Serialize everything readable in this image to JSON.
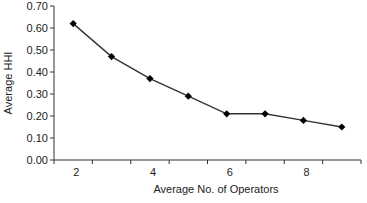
{
  "chart_data": {
    "type": "line",
    "title": "",
    "xlabel": "Average No. of Operators",
    "ylabel": "Average HHI",
    "categories": [
      2,
      3,
      4,
      5,
      6,
      7,
      8,
      9
    ],
    "x_tick_labels": [
      "2",
      "4",
      "6",
      "8"
    ],
    "y_tick_labels": [
      "0.00",
      "0.10",
      "0.20",
      "0.30",
      "0.40",
      "0.50",
      "0.60",
      "0.70"
    ],
    "ylim": [
      0,
      0.7
    ],
    "grid": false,
    "legend": null,
    "series": [
      {
        "name": "Average HHI",
        "marker": "diamond",
        "color": "#000000",
        "values": [
          0.62,
          0.47,
          0.37,
          0.29,
          0.21,
          0.21,
          0.18,
          0.15
        ]
      }
    ]
  }
}
